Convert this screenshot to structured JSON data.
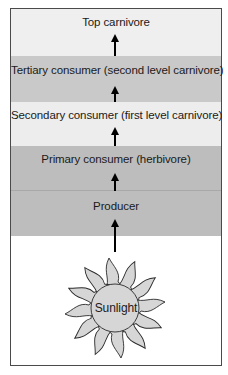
{
  "levels": [
    {
      "label": "Top carnivore",
      "color": "#efefef"
    },
    {
      "label": "Tertiary consumer (second level carnivore)",
      "color": "#c9c9c9"
    },
    {
      "label": "Secondary consumer (first level carnivore)",
      "color": "#ededed"
    },
    {
      "label": "Primary consumer (herbivore)",
      "color": "#bdbdbd"
    },
    {
      "label": "Producer",
      "color": "#bdbdbd"
    }
  ],
  "source": {
    "label": "Sunlight",
    "icon": "sun-icon",
    "fill": "#d6d6d6"
  }
}
